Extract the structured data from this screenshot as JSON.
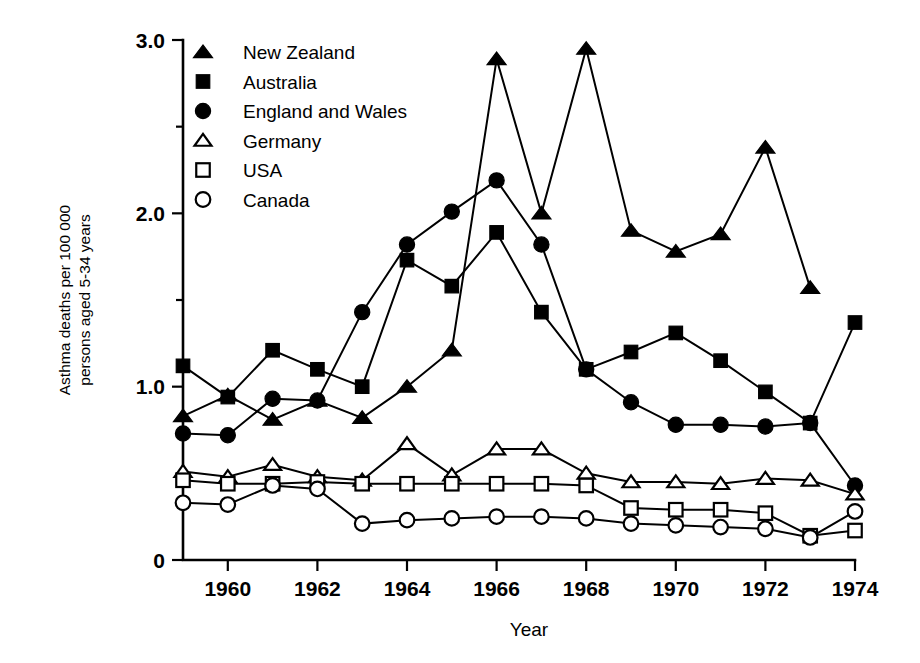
{
  "chart_data": {
    "type": "line",
    "title": "",
    "xlabel": "Year",
    "ylabel": "Asthma deaths per 100 000 persons aged 5-34 years",
    "ylabel_line1": "Asthma deaths per 100 000",
    "ylabel_line2": "persons aged 5-34 years",
    "x": [
      1959,
      1960,
      1961,
      1962,
      1963,
      1964,
      1965,
      1966,
      1967,
      1968,
      1969,
      1970,
      1971,
      1972,
      1973,
      1974
    ],
    "xlim": [
      1959,
      1974
    ],
    "ylim": [
      0,
      3.0
    ],
    "xticks": [
      1960,
      1962,
      1964,
      1966,
      1968,
      1970,
      1972,
      1974
    ],
    "xtick_labels": [
      "1960",
      "1962",
      "1964",
      "1966",
      "1968",
      "1970",
      "1972",
      "1974"
    ],
    "yticks": [
      0,
      1.0,
      2.0,
      3.0
    ],
    "ytick_labels": [
      "0",
      "1.0",
      "2.0",
      "3.0"
    ],
    "yticks_minor": [
      0.5,
      1.5,
      2.5
    ],
    "grid": false,
    "legend_position": "top-left",
    "series": [
      {
        "name": "New Zealand",
        "marker": "triangle-filled",
        "x": [
          1959,
          1960,
          1961,
          1962,
          1963,
          1964,
          1965,
          1966,
          1967,
          1968,
          1969,
          1970,
          1971,
          1972,
          1973
        ],
        "values": [
          0.83,
          0.95,
          0.81,
          0.92,
          0.82,
          1.0,
          1.21,
          2.89,
          2.0,
          2.95,
          1.9,
          1.78,
          1.88,
          2.38,
          1.57
        ]
      },
      {
        "name": "Australia",
        "marker": "square-filled",
        "x": [
          1959,
          1960,
          1961,
          1962,
          1963,
          1964,
          1965,
          1966,
          1967,
          1968,
          1969,
          1970,
          1971,
          1972,
          1973,
          1974
        ],
        "values": [
          1.12,
          0.94,
          1.21,
          1.1,
          1.0,
          1.73,
          1.58,
          1.89,
          1.43,
          1.1,
          1.2,
          1.31,
          1.15,
          0.97,
          0.79,
          1.37
        ]
      },
      {
        "name": "England  and Wales",
        "marker": "circle-filled",
        "x": [
          1959,
          1960,
          1961,
          1962,
          1963,
          1964,
          1965,
          1966,
          1967,
          1968,
          1969,
          1970,
          1971,
          1972,
          1973,
          1974
        ],
        "values": [
          0.73,
          0.72,
          0.93,
          0.92,
          1.43,
          1.82,
          2.01,
          2.19,
          1.82,
          1.1,
          0.91,
          0.78,
          0.78,
          0.77,
          0.79,
          0.43
        ]
      },
      {
        "name": "Germany",
        "marker": "triangle-open",
        "x": [
          1959,
          1960,
          1961,
          1962,
          1963,
          1964,
          1965,
          1966,
          1967,
          1968,
          1969,
          1970,
          1971,
          1972,
          1973,
          1974
        ],
        "values": [
          0.51,
          0.48,
          0.55,
          0.48,
          0.46,
          0.67,
          0.49,
          0.64,
          0.64,
          0.5,
          0.45,
          0.45,
          0.44,
          0.47,
          0.46,
          0.38
        ]
      },
      {
        "name": "USA",
        "marker": "square-open",
        "x": [
          1959,
          1960,
          1961,
          1962,
          1963,
          1964,
          1965,
          1966,
          1967,
          1968,
          1969,
          1970,
          1971,
          1972,
          1973,
          1974
        ],
        "values": [
          0.46,
          0.44,
          0.44,
          0.45,
          0.44,
          0.44,
          0.44,
          0.44,
          0.44,
          0.43,
          0.3,
          0.29,
          0.29,
          0.27,
          0.14,
          0.17
        ]
      },
      {
        "name": "Canada",
        "marker": "circle-open",
        "x": [
          1959,
          1960,
          1961,
          1962,
          1963,
          1964,
          1965,
          1966,
          1967,
          1968,
          1969,
          1970,
          1971,
          1972,
          1973,
          1974
        ],
        "values": [
          0.33,
          0.32,
          0.43,
          0.41,
          0.21,
          0.23,
          0.24,
          0.25,
          0.25,
          0.24,
          0.21,
          0.2,
          0.19,
          0.18,
          0.13,
          0.28
        ]
      }
    ]
  },
  "legend": {
    "items": [
      {
        "label": "New Zealand",
        "marker": "triangle-filled"
      },
      {
        "label": "Australia",
        "marker": "square-filled"
      },
      {
        "label": "England  and Wales",
        "marker": "circle-filled"
      },
      {
        "label": "Germany",
        "marker": "triangle-open"
      },
      {
        "label": "USA",
        "marker": "square-open"
      },
      {
        "label": "Canada",
        "marker": "circle-open"
      }
    ]
  },
  "colors": {
    "ink": "#000000",
    "paper": "#ffffff"
  }
}
